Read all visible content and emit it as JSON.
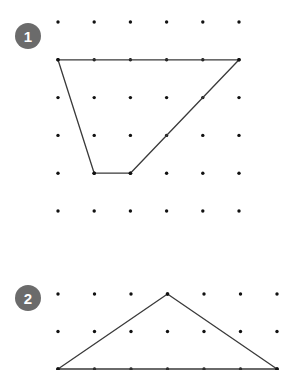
{
  "problems": [
    {
      "label": "1",
      "grid": {
        "columns": 6,
        "rows": 6
      },
      "shape": "quadrilateral",
      "vertices": [
        [
          0,
          1
        ],
        [
          5,
          1
        ],
        [
          2,
          4
        ],
        [
          1,
          4
        ]
      ]
    },
    {
      "label": "2",
      "grid": {
        "columns": 7,
        "rows": 3
      },
      "shape": "triangle",
      "vertices": [
        [
          3,
          0
        ],
        [
          6,
          2
        ],
        [
          0,
          2
        ]
      ]
    }
  ],
  "colors": {
    "badge": "#6b6b6b",
    "dot": "#111111",
    "line": "#3a3a3a"
  }
}
